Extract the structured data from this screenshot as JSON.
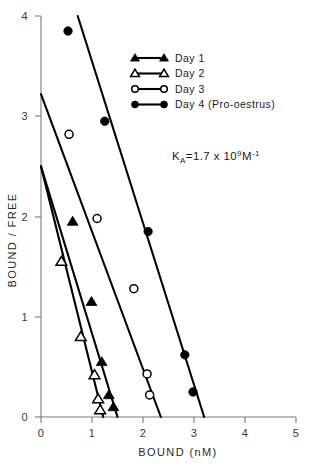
{
  "chart_data": {
    "type": "scatter",
    "title": "",
    "xlabel": "BOUND (nM)",
    "ylabel": "BOUND / FREE",
    "xlim": [
      0,
      5
    ],
    "ylim": [
      0,
      4
    ],
    "xticks": [
      0,
      1,
      2,
      3,
      4,
      5
    ],
    "yticks": [
      0,
      1,
      2,
      3,
      4
    ],
    "xtick_labels": [
      "0",
      "1",
      "2",
      "3",
      "4",
      "5"
    ],
    "ytick_labels": [
      "0",
      "1",
      "2",
      "3",
      "4"
    ],
    "grid": false,
    "legend_position": "upper-center-right",
    "annotation": {
      "text": "KA=1.7 x 109 M-1",
      "prefix": "K",
      "sub1": "A",
      "mid": "=1.7 x 10",
      "sup1": "9",
      "unit": "M",
      "sup2": "-1"
    },
    "series": [
      {
        "name": "Day 1",
        "marker": "filled-triangle",
        "color": "#000000",
        "points": [
          {
            "x": 0.62,
            "y": 1.95
          },
          {
            "x": 0.99,
            "y": 1.15
          },
          {
            "x": 1.19,
            "y": 0.55
          },
          {
            "x": 1.33,
            "y": 0.22
          },
          {
            "x": 1.42,
            "y": 0.1
          }
        ],
        "fit_line": {
          "x0": 0.0,
          "y0": 2.5,
          "x1": 1.5,
          "y1": 0.0
        }
      },
      {
        "name": "Day 2",
        "marker": "open-triangle",
        "color": "#000000",
        "points": [
          {
            "x": 0.4,
            "y": 1.55
          },
          {
            "x": 0.78,
            "y": 0.8
          },
          {
            "x": 1.05,
            "y": 0.42
          },
          {
            "x": 1.12,
            "y": 0.18
          },
          {
            "x": 1.16,
            "y": 0.07
          }
        ],
        "fit_line": {
          "x0": 0.0,
          "y0": 2.5,
          "x1": 1.22,
          "y1": 0.0
        }
      },
      {
        "name": "Day 3",
        "marker": "open-circle",
        "color": "#000000",
        "points": [
          {
            "x": 0.55,
            "y": 2.82
          },
          {
            "x": 1.1,
            "y": 1.98
          },
          {
            "x": 1.82,
            "y": 1.28
          },
          {
            "x": 2.08,
            "y": 0.43
          },
          {
            "x": 2.13,
            "y": 0.22
          }
        ],
        "fit_line": {
          "x0": 0.0,
          "y0": 3.22,
          "x1": 2.35,
          "y1": 0.0
        }
      },
      {
        "name": "Day 4 (Pro-oestrus)",
        "marker": "filled-circle",
        "color": "#000000",
        "points": [
          {
            "x": 0.53,
            "y": 3.85
          },
          {
            "x": 1.25,
            "y": 2.95
          },
          {
            "x": 2.1,
            "y": 1.85
          },
          {
            "x": 2.82,
            "y": 0.62
          },
          {
            "x": 2.98,
            "y": 0.25
          }
        ],
        "fit_line": {
          "x0": 0.72,
          "y0": 4.0,
          "x1": 3.2,
          "y1": 0.0
        }
      }
    ]
  },
  "legend": {
    "entries": [
      {
        "label": "Day 1",
        "marker": "filled-triangle"
      },
      {
        "label": "Day 2",
        "marker": "open-triangle"
      },
      {
        "label": "Day 3",
        "marker": "open-circle"
      },
      {
        "label": "Day 4 (Pro-oestrus)",
        "marker": "filled-circle"
      }
    ]
  },
  "axes": {
    "x_title": "BOUND (nM)",
    "y_title": "BOUND / FREE"
  }
}
